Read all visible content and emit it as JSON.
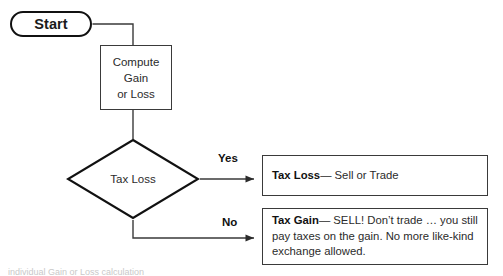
{
  "diagram": {
    "type": "flowchart",
    "background_color": "#ffffff",
    "line_color": "#3a3a3a",
    "text_color": "#2b2b2b",
    "nodes": {
      "start": {
        "label": "Start",
        "shape": "stadium"
      },
      "process": {
        "shape": "rectangle",
        "lines": [
          "Compute",
          "Gain",
          "or Loss"
        ]
      },
      "decision": {
        "shape": "diamond",
        "label": "Tax Loss"
      },
      "outcome_yes": {
        "shape": "rectangle",
        "heading": "Tax Loss",
        "dash": "—",
        "body": "Sell or Trade"
      },
      "outcome_no": {
        "shape": "rectangle",
        "heading": "Tax Gain",
        "dash": "—",
        "body_line1": "SELL! Don’t trade … you still",
        "body_line2": "pay taxes on the gain.  No more like-kind",
        "body_line3": "exchange allowed."
      }
    },
    "branches": {
      "yes": "Yes",
      "no": "No"
    },
    "caption_sliver": "individual Gain or Loss calculation"
  }
}
